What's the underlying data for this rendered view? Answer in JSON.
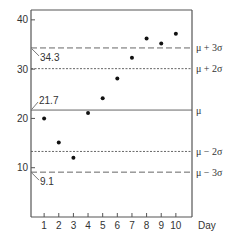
{
  "chart_data": {
    "type": "scatter",
    "title": "",
    "xlabel": "Day",
    "ylabel": "",
    "xlim": [
      0,
      11
    ],
    "ylim": [
      0,
      42
    ],
    "x_ticks": [
      1,
      2,
      3,
      4,
      5,
      6,
      7,
      8,
      9,
      10
    ],
    "x_tick_labels": [
      "1",
      "2",
      "3",
      "4",
      "5",
      "6",
      "7",
      "8",
      "9",
      "10"
    ],
    "y_ticks": [
      10,
      20,
      30,
      40
    ],
    "y_tick_labels": [
      "10",
      "20",
      "30",
      "40"
    ],
    "grid": false,
    "series": [
      {
        "name": "Daily measurement",
        "x": [
          1,
          2,
          3,
          4,
          5,
          6,
          7,
          8,
          9,
          10
        ],
        "y": [
          20.0,
          15.1,
          12.0,
          21.1,
          24.1,
          28.1,
          32.3,
          36.2,
          35.2,
          37.2
        ]
      }
    ],
    "reference_lines": [
      {
        "name": "mu-plus-3sigma",
        "label": "μ + 3σ",
        "value": 34.3,
        "style": "dashed"
      },
      {
        "name": "mu-plus-2sigma",
        "label": "μ + 2σ",
        "value": 30.1,
        "style": "dotted"
      },
      {
        "name": "mu",
        "label": "μ",
        "value": 21.7,
        "style": "solid"
      },
      {
        "name": "mu-minus-2sigma",
        "label": "μ − 2σ",
        "value": 13.3,
        "style": "dotted"
      },
      {
        "name": "mu-minus-3sigma",
        "label": "μ − 3σ",
        "value": 9.1,
        "style": "dashed"
      }
    ],
    "annotations": [
      {
        "name": "annotation-upper-limit",
        "text": "34.3",
        "value": 34.3,
        "placement": "below-left"
      },
      {
        "name": "annotation-mean",
        "text": "21.7",
        "value": 21.7,
        "placement": "above-left"
      },
      {
        "name": "annotation-lower-limit",
        "text": "9.1",
        "value": 9.1,
        "placement": "below-left"
      }
    ],
    "colors": {
      "axis": "#555555",
      "points": "#111111",
      "lines": "#666666"
    }
  }
}
